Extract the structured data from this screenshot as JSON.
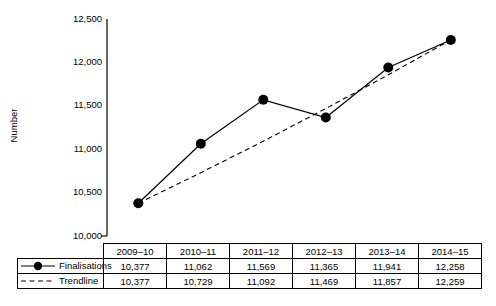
{
  "chart_data": {
    "type": "line",
    "title": "",
    "xlabel": "",
    "ylabel": "Number",
    "categories": [
      "2009–10",
      "2010–11",
      "2011–12",
      "2012–13",
      "2013–14",
      "2014–15"
    ],
    "series": [
      {
        "name": "Finalisations",
        "style": "solid-with-markers",
        "values": [
          10377,
          11062,
          11569,
          11365,
          11941,
          12258
        ],
        "labels": [
          "10,377",
          "11,062",
          "11,569",
          "11,365",
          "11,941",
          "12,258"
        ]
      },
      {
        "name": "Trendline",
        "style": "dashed",
        "values": [
          10377,
          10729,
          11092,
          11469,
          11857,
          12259
        ],
        "labels": [
          "10,377",
          "10,729",
          "11,092",
          "11,469",
          "11,857",
          "12,259"
        ]
      }
    ],
    "ylim": [
      10000,
      12500
    ],
    "yticks": [
      10000,
      10500,
      11000,
      11500,
      12000,
      12500
    ],
    "ytick_labels": [
      "10,000",
      "10,500",
      "11,000",
      "11,500",
      "12,000",
      "12,500"
    ],
    "grid": false,
    "legend_position": "table-left-column",
    "colors": {
      "series_line": "#000000",
      "marker": "#000000",
      "trendline": "#000000",
      "axis": "#000000",
      "background": "#ffffff"
    }
  },
  "table": {
    "header_row": [
      "2009–10",
      "2010–11",
      "2011–12",
      "2012–13",
      "2013–14",
      "2014–15"
    ],
    "rows": [
      {
        "label": "Finalisations",
        "marker": "solid-line-circle",
        "values": [
          "10,377",
          "11,062",
          "11,569",
          "11,365",
          "11,941",
          "12,258"
        ]
      },
      {
        "label": "Trendline",
        "marker": "dashed-line",
        "values": [
          "10,377",
          "10,729",
          "11,092",
          "11,469",
          "11,857",
          "12,259"
        ]
      }
    ]
  }
}
